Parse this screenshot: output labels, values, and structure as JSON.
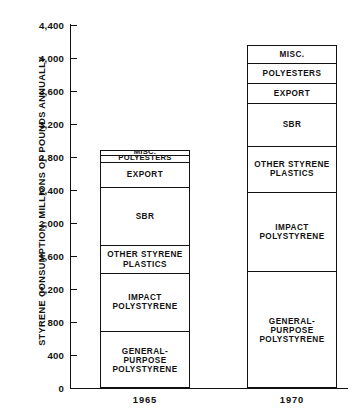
{
  "chart_data": {
    "type": "bar",
    "title": "",
    "subtitle": "",
    "xlabel": "",
    "ylabel": "STYRENE CONSUMPTION, MILLIONS OF POUNDS ANNUALLY",
    "categories": [
      "1965",
      "1970"
    ],
    "ylim": [
      0,
      4400
    ],
    "yticks": [
      0,
      400,
      800,
      1200,
      1600,
      2000,
      2400,
      2800,
      3200,
      3600,
      4000,
      4400
    ],
    "ytick_labels": [
      "0",
      "400",
      "800",
      "1,200",
      "1,600",
      "2,000",
      "2,400",
      "2,800",
      "3,200",
      "3,600",
      "4,000",
      "4,400"
    ],
    "grid": false,
    "legend": "none (segments labelled in place)",
    "stacked": true,
    "series": [
      {
        "name": "GENERAL-\nPURPOSE\nPOLYSTYRENE",
        "values": [
          690,
          1420
        ]
      },
      {
        "name": "IMPACT\nPOLYSTYRENE",
        "values": [
          705,
          960
        ]
      },
      {
        "name": "OTHER STYRENE\nPLASTICS",
        "values": [
          335,
          550
        ]
      },
      {
        "name": "SBR",
        "values": [
          710,
          530
        ]
      },
      {
        "name": "EXPORT",
        "values": [
          300,
          240
        ]
      },
      {
        "name": "POLYESTERS",
        "values": [
          90,
          240
        ]
      },
      {
        "name": "MISC.",
        "values": [
          60,
          220
        ]
      }
    ],
    "totals": [
      2890,
      4160
    ],
    "bars": [
      {
        "category": "1965",
        "total": 2890,
        "segments": [
          {
            "label": "MISC.",
            "value": 60,
            "y0": 2830,
            "y1": 2890
          },
          {
            "label": "POLYESTERS",
            "value": 90,
            "y0": 2740,
            "y1": 2830
          },
          {
            "label": "EXPORT",
            "value": 300,
            "y0": 2440,
            "y1": 2740
          },
          {
            "label": "SBR",
            "value": 710,
            "y0": 1730,
            "y1": 2440
          },
          {
            "label": "OTHER STYRENE\nPLASTICS",
            "value": 335,
            "y0": 1395,
            "y1": 1730
          },
          {
            "label": "IMPACT\nPOLYSTYRENE",
            "value": 705,
            "y0": 690,
            "y1": 1395
          },
          {
            "label": "GENERAL-\nPURPOSE\nPOLYSTYRENE",
            "value": 690,
            "y0": 0,
            "y1": 690
          }
        ]
      },
      {
        "category": "1970",
        "total": 4160,
        "segments": [
          {
            "label": "MISC.",
            "value": 220,
            "y0": 3940,
            "y1": 4160
          },
          {
            "label": "POLYESTERS",
            "value": 240,
            "y0": 3700,
            "y1": 3940
          },
          {
            "label": "EXPORT",
            "value": 240,
            "y0": 3460,
            "y1": 3700
          },
          {
            "label": "SBR",
            "value": 530,
            "y0": 2930,
            "y1": 3460
          },
          {
            "label": "OTHER STYRENE\nPLASTICS",
            "value": 550,
            "y0": 2380,
            "y1": 2930
          },
          {
            "label": "IMPACT\nPOLYSTYRENE",
            "value": 960,
            "y0": 1420,
            "y1": 2380
          },
          {
            "label": "GENERAL-\nPURPOSE\nPOLYSTYRENE",
            "value": 1420,
            "y0": 0,
            "y1": 1420
          }
        ]
      }
    ],
    "colors": {
      "axis": "#111111",
      "bar_fill": "#ffffff",
      "bar_stroke": "#111111",
      "text": "#111111",
      "background": "#ffffff"
    }
  }
}
